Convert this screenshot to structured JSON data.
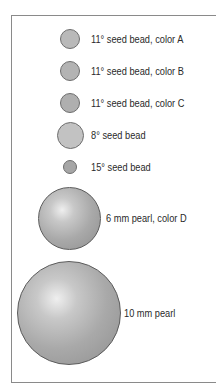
{
  "legend": {
    "items": [
      {
        "label": "11° seed bead, color A",
        "type": "seed-bead",
        "color": "#b9b9b9"
      },
      {
        "label": "11° seed bead, color B",
        "type": "seed-bead",
        "color": "#b3b3b3"
      },
      {
        "label": "11° seed bead, color C",
        "type": "seed-bead",
        "color": "#afafaf"
      },
      {
        "label": "8° seed bead",
        "type": "seed-bead",
        "color": "#c2c2c2"
      },
      {
        "label": "15° seed bead",
        "type": "seed-bead",
        "color": "#a6a6a6"
      },
      {
        "label": "6 mm pearl, color D",
        "type": "pearl",
        "color": "#a9a9a9"
      },
      {
        "label": "10 mm pearl",
        "type": "pearl",
        "color": "#b0b0b0"
      }
    ]
  }
}
